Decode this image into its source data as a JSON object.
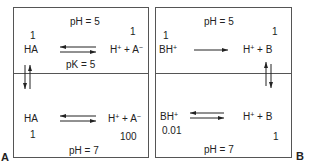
{
  "panels": [
    {
      "label": "A",
      "top": {
        "ph": "pH = 5",
        "left_conc": "1",
        "left_species": "HA",
        "right_conc": "1",
        "right_species_h": "H",
        "right_species_h_sup": "+",
        "right_species_plus": " + A",
        "right_species_sup": "−",
        "pk": "pK = 5",
        "arrow": "equilibrium"
      },
      "bottom": {
        "ph": "pH = 7",
        "left_conc": "1",
        "left_species": "HA",
        "right_conc": "100",
        "right_species_h": "H",
        "right_species_h_sup": "+",
        "right_species_plus": " + A",
        "right_species_sup": "−",
        "arrow": "equilibrium"
      },
      "vertical_arrow": "equilibrium-left"
    },
    {
      "label": "B",
      "top": {
        "ph": "pH = 5",
        "left_conc": "1",
        "left_species": "BH",
        "left_species_sup": "+",
        "right_conc": "1",
        "right_species_h": "H",
        "right_species_h_sup": "+",
        "right_species_plus": " + B",
        "arrow": "forward"
      },
      "bottom": {
        "ph": "pH = 7",
        "left_conc": "0.01",
        "left_species": "BH",
        "left_species_sup": "+",
        "right_conc": "1",
        "right_species_h": "H",
        "right_species_h_sup": "+",
        "right_species_plus": " + B",
        "arrow": "equilibrium"
      },
      "vertical_arrow": "equilibrium-right"
    }
  ]
}
